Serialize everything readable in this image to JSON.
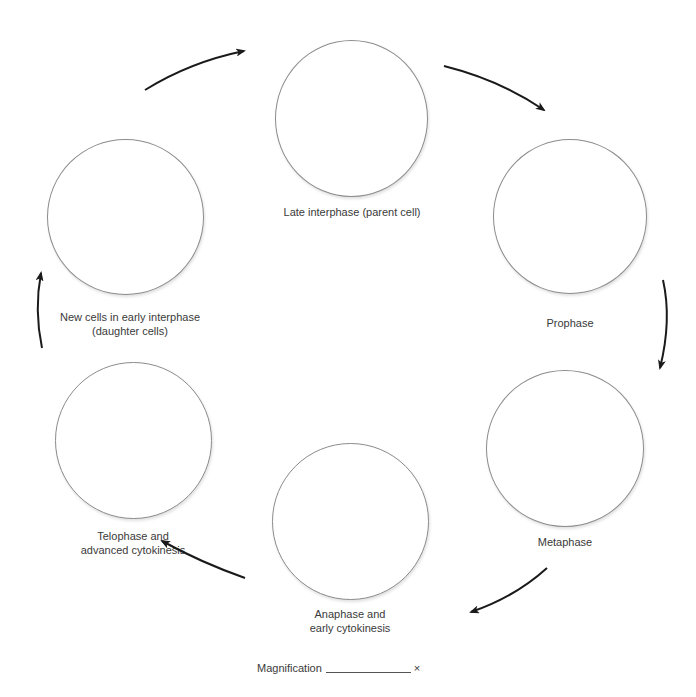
{
  "diagram": {
    "type": "cell-cycle-worksheet",
    "stages": [
      {
        "id": "late-interphase",
        "label_lines": [
          "Late interphase (parent cell)"
        ]
      },
      {
        "id": "prophase",
        "label_lines": [
          "Prophase"
        ]
      },
      {
        "id": "metaphase",
        "label_lines": [
          "Metaphase"
        ]
      },
      {
        "id": "anaphase",
        "label_lines": [
          "Anaphase and",
          "early cytokinesis"
        ]
      },
      {
        "id": "telophase",
        "label_lines": [
          "Telophase and",
          "advanced cytokinesis"
        ]
      },
      {
        "id": "early-interphase",
        "label_lines": [
          "New cells in early interphase",
          "(daughter cells)"
        ]
      }
    ],
    "arrow_direction": "clockwise",
    "magnification": {
      "label": "Magnification",
      "suffix": "×",
      "value": ""
    },
    "colors": {
      "circle_stroke": "#8c8c8c",
      "arrow": "#1a1a1a",
      "text": "#3a3a3a"
    }
  }
}
